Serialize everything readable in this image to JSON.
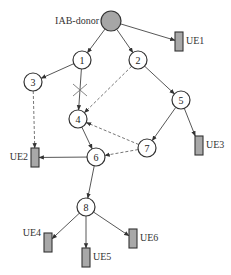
{
  "diagram": {
    "donor": {
      "id": "donor",
      "label": "IAB-donor",
      "x": 111,
      "y": 21,
      "r": 10
    },
    "nodes": [
      {
        "id": "1",
        "label": "1",
        "x": 82,
        "y": 60
      },
      {
        "id": "2",
        "label": "2",
        "x": 138,
        "y": 60
      },
      {
        "id": "3",
        "label": "3",
        "x": 33,
        "y": 82
      },
      {
        "id": "4",
        "label": "4",
        "x": 78,
        "y": 119
      },
      {
        "id": "5",
        "label": "5",
        "x": 181,
        "y": 100
      },
      {
        "id": "6",
        "label": "6",
        "x": 96,
        "y": 157
      },
      {
        "id": "7",
        "label": "7",
        "x": 147,
        "y": 148
      },
      {
        "id": "8",
        "label": "8",
        "x": 86,
        "y": 207
      }
    ],
    "ues": [
      {
        "id": "UE1",
        "label": "UE1",
        "x": 175,
        "y": 32,
        "label_side": "right"
      },
      {
        "id": "UE2",
        "label": "UE2",
        "x": 31,
        "y": 148,
        "label_side": "left"
      },
      {
        "id": "UE3",
        "label": "UE3",
        "x": 195,
        "y": 136,
        "label_side": "right"
      },
      {
        "id": "UE4",
        "label": "UE4",
        "x": 44,
        "y": 233,
        "label_side": "left-top"
      },
      {
        "id": "UE5",
        "label": "UE5",
        "x": 82,
        "y": 248,
        "label_side": "right"
      },
      {
        "id": "UE6",
        "label": "UE6",
        "x": 129,
        "y": 229,
        "label_side": "right"
      }
    ],
    "edges": [
      {
        "from": "donor",
        "to": "1",
        "style": "solid"
      },
      {
        "from": "donor",
        "to": "2",
        "style": "solid"
      },
      {
        "from": "donor",
        "to": "UE1",
        "style": "solid"
      },
      {
        "from": "1",
        "to": "3",
        "style": "solid"
      },
      {
        "from": "1",
        "to": "4",
        "style": "solid",
        "broken": true
      },
      {
        "from": "2",
        "to": "4",
        "style": "dashed"
      },
      {
        "from": "2",
        "to": "5",
        "style": "solid"
      },
      {
        "from": "3",
        "to": "UE2",
        "style": "dashed"
      },
      {
        "from": "4",
        "to": "6",
        "style": "solid"
      },
      {
        "from": "5",
        "to": "7",
        "style": "solid"
      },
      {
        "from": "5",
        "to": "UE3",
        "style": "solid"
      },
      {
        "from": "7",
        "to": "4",
        "style": "dashed"
      },
      {
        "from": "7",
        "to": "6",
        "style": "dashed"
      },
      {
        "from": "6",
        "to": "UE2",
        "style": "solid"
      },
      {
        "from": "6",
        "to": "8",
        "style": "solid"
      },
      {
        "from": "8",
        "to": "UE4",
        "style": "solid"
      },
      {
        "from": "8",
        "to": "UE5",
        "style": "solid"
      },
      {
        "from": "8",
        "to": "UE6",
        "style": "solid"
      }
    ],
    "broken_link_marker": {
      "icon": "cross-icon",
      "x": 80,
      "y": 90
    },
    "colors": {
      "donor_fill": "#a6a6a6",
      "ue_fill": "#a8a8a8",
      "stroke": "#333333"
    }
  }
}
